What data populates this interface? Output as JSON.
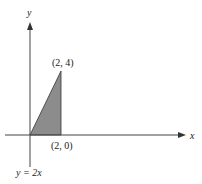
{
  "diagram": {
    "axes": {
      "x_label": "x",
      "y_label": "y"
    },
    "region": {
      "shape": "triangle",
      "vertices": [
        [
          0,
          0
        ],
        [
          2,
          0
        ],
        [
          2,
          4
        ]
      ],
      "fill_color": "#8c8c8c",
      "stroke_color": "#333333"
    },
    "points": [
      {
        "label": "(2, 4)",
        "x": 2,
        "y": 4
      },
      {
        "label": "(2, 0)",
        "x": 2,
        "y": 0
      }
    ],
    "curve_label": "y = 2x",
    "colors": {
      "axis": "#444444",
      "background": "#ffffff"
    }
  }
}
